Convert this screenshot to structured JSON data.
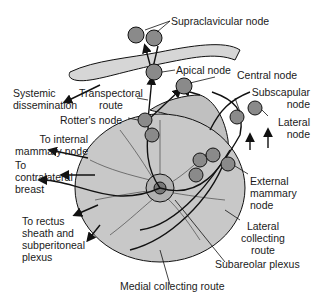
{
  "diagram": {
    "colors": {
      "breast_fill": "#c8c8c8",
      "node_fill": "#8a8a8a",
      "clavicle_fill": "#d6d6d6",
      "line": "#111111",
      "text": "#1a1a1a"
    },
    "labels": {
      "supraclavicular": "Supraclavicular node",
      "apical": "Apical node",
      "central": "Central node",
      "subscapular": "Subscapular\nnode",
      "lateral_node": "Lateral\nnode",
      "systemic": "Systemic\ndissemination",
      "transpectoral": "Transpectoral\nroute",
      "rotters": "Rotter's node",
      "internal_mammary": "To internal\nmammary node",
      "contralateral": "To\ncontralateral\nbreast",
      "rectus": "To rectus\nsheath and\nsubperitoneal\nplexus",
      "external_mammary": "External\nmammary\nnode",
      "lateral_collecting": "Lateral\ncollecting\nroute",
      "subareolar": "Subareolar plexus",
      "medial_collecting": "Medial collecting route"
    }
  }
}
